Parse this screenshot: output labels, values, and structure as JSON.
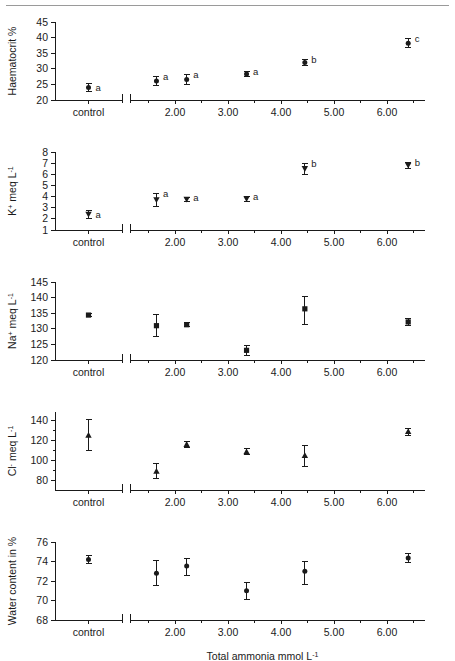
{
  "figure": {
    "width": 455,
    "height": 661,
    "background": "#ffffff",
    "rule_color": "#9a9a9a",
    "ink_color": "#1a1a1a",
    "xlabel": "Total ammonia mmol L",
    "xlabel_sup": "-1",
    "control_tick_label": "control",
    "x_tick_labels": [
      "2.00",
      "3.00",
      "4.00",
      "5.00",
      "6.00"
    ],
    "x_tick_values": [
      2.0,
      3.0,
      4.0,
      5.0,
      6.0
    ]
  },
  "chart_data": [
    {
      "type": "scatter",
      "title": "Haematocrit %",
      "ylabel": "Haematocrit %",
      "xlabel": "Total ammonia mmol L-1",
      "ylim": [
        20,
        45
      ],
      "yticks": [
        20,
        25,
        30,
        35,
        40,
        45
      ],
      "ytick_labels": [
        "20",
        "25",
        "30",
        "35",
        "40",
        "45"
      ],
      "grid": false,
      "legend": "none",
      "marker": "circle",
      "control": {
        "x_label": "control",
        "y": 24.0,
        "err_low": 1.2,
        "err_high": 1.2,
        "letter": "a"
      },
      "x": [
        1.65,
        2.22,
        3.35,
        4.45,
        6.4
      ],
      "values": [
        26.1,
        26.6,
        28.3,
        32.0,
        38.2
      ],
      "err_low": [
        1.5,
        1.7,
        0.8,
        1.0,
        1.4
      ],
      "err_high": [
        1.5,
        1.7,
        0.8,
        1.0,
        1.4
      ],
      "letters": [
        "a",
        "a",
        "a",
        "b",
        "c"
      ]
    },
    {
      "type": "scatter",
      "title": "K+ meq L-1",
      "ylabel_main": "K",
      "ylabel_sup1": "+",
      "ylabel_mid": " meq L",
      "ylabel_sup2": "-1",
      "ylim": [
        1,
        8
      ],
      "yticks": [
        1,
        2,
        3,
        4,
        5,
        6,
        7,
        8
      ],
      "ytick_labels": [
        "1",
        "2",
        "3",
        "4",
        "5",
        "6",
        "7",
        "8"
      ],
      "grid": false,
      "legend": "none",
      "marker": "triangle-down",
      "control": {
        "x_label": "control",
        "y": 2.4,
        "err_low": 0.35,
        "err_high": 0.35,
        "letter": "a"
      },
      "x": [
        1.65,
        2.22,
        3.35,
        4.45,
        6.4
      ],
      "values": [
        3.7,
        3.75,
        3.8,
        6.5,
        6.8
      ],
      "err_low": [
        0.55,
        0.2,
        0.2,
        0.5,
        0.25
      ],
      "err_high": [
        0.55,
        0.2,
        0.2,
        0.5,
        0.25
      ],
      "letters": [
        "a",
        "a",
        "a",
        "b",
        "b"
      ]
    },
    {
      "type": "scatter",
      "title": "Na+ meq L-1",
      "ylabel_main": "Na",
      "ylabel_sup1": "+",
      "ylabel_mid": " meq L",
      "ylabel_sup2": "-1",
      "ylim": [
        120,
        145
      ],
      "yticks": [
        120,
        125,
        130,
        135,
        140,
        145
      ],
      "ytick_labels": [
        "120",
        "125",
        "130",
        "135",
        "140",
        "145"
      ],
      "grid": false,
      "legend": "none",
      "marker": "square",
      "control": {
        "x_label": "control",
        "y": 134.4,
        "err_low": 0.5,
        "err_high": 0.5,
        "letter": ""
      },
      "x": [
        1.65,
        2.22,
        3.35,
        4.45,
        6.4
      ],
      "values": [
        131.0,
        131.3,
        123.1,
        136.4,
        132.2
      ],
      "err_low": [
        3.6,
        0.6,
        1.6,
        4.9,
        1.2
      ],
      "err_high": [
        3.6,
        0.6,
        1.6,
        4.0,
        1.2
      ],
      "letters": [
        "",
        "",
        "",
        "",
        ""
      ]
    },
    {
      "type": "scatter",
      "title": "Cl- meq L-1",
      "ylabel_main": "Cl",
      "ylabel_sup1": "-",
      "ylabel_mid": " meq L",
      "ylabel_sup2": "-1",
      "ylim": [
        70,
        148
      ],
      "yticks": [
        80,
        100,
        120,
        140
      ],
      "ytick_labels": [
        "80",
        "100",
        "120",
        "140"
      ],
      "grid": false,
      "legend": "none",
      "marker": "triangle-up",
      "control": {
        "x_label": "control",
        "y": 124.8,
        "err_low": 15.5,
        "err_high": 15.5,
        "letter": ""
      },
      "x": [
        1.65,
        2.22,
        3.35,
        4.45,
        6.4
      ],
      "values": [
        88.8,
        115.7,
        108.3,
        104.5,
        128.5
      ],
      "err_low": [
        7.5,
        2.8,
        3.0,
        10.5,
        3.5
      ],
      "err_high": [
        7.5,
        2.8,
        3.0,
        10.5,
        3.5
      ],
      "letters": [
        "",
        "",
        "",
        "",
        ""
      ]
    },
    {
      "type": "scatter",
      "title": "Water content in %",
      "ylabel": "Water content in %",
      "ylim": [
        68,
        76
      ],
      "yticks": [
        68,
        70,
        72,
        74,
        76
      ],
      "ytick_labels": [
        "68",
        "70",
        "72",
        "74",
        "76"
      ],
      "grid": false,
      "legend": "none",
      "marker": "circle",
      "control": {
        "x_label": "control",
        "y": 74.2,
        "err_low": 0.45,
        "err_high": 0.45,
        "letter": ""
      },
      "x": [
        1.65,
        2.22,
        3.35,
        4.45,
        6.4
      ],
      "values": [
        72.8,
        73.55,
        71.0,
        73.0,
        74.35
      ],
      "err_low": [
        1.3,
        1.0,
        0.85,
        1.35,
        0.45
      ],
      "err_high": [
        1.3,
        0.75,
        0.85,
        0.95,
        0.45
      ],
      "letters": [
        "",
        "",
        "",
        "",
        ""
      ]
    }
  ]
}
